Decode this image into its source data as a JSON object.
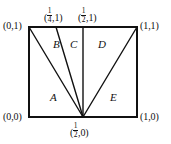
{
  "figure": {
    "type": "geometry-diagram",
    "background_color": "#ffffff",
    "line_color": "#111111",
    "border_width_px": 2,
    "interior_line_width_px": 1.4,
    "square": {
      "corners": {
        "bottom_left": "(0,0)",
        "bottom_right": "(1,0)",
        "top_right": "(1,1)",
        "top_left": "(0,1)"
      }
    },
    "apex": {
      "label_parts": {
        "x_num": "1",
        "x_den": "2",
        "y": "0"
      },
      "label_plain": "(1/2,0)",
      "position": "bottom edge midpoint"
    },
    "top_marks": [
      {
        "name": "quarter-top",
        "label_parts": {
          "x_num": "1",
          "x_den": "4",
          "y": "1"
        },
        "label_plain": "(1/4,1)"
      },
      {
        "name": "half-top",
        "label_parts": {
          "x_num": "1",
          "x_den": "2",
          "y": "1"
        },
        "label_plain": "(1/2,1)"
      }
    ],
    "corner_labels": {
      "top_left": "(0,1)",
      "top_right": "(1,1)",
      "bottom_left": "(0,0)",
      "bottom_right": "(1,0)"
    },
    "regions": [
      {
        "id": "A",
        "label": "A",
        "note": "lower-left region"
      },
      {
        "id": "B",
        "label": "B",
        "note": "upper wedge between (0,1) and (1/4,1) rays"
      },
      {
        "id": "C",
        "label": "C",
        "note": "narrow wedge between (1/4,1) and (1/2,1) rays"
      },
      {
        "id": "D",
        "label": "D",
        "note": "wedge between (1/2,1) and (1,1) rays"
      },
      {
        "id": "E",
        "label": "E",
        "note": "lower-right region"
      }
    ],
    "rays_from_apex": [
      {
        "to": "(0,1)"
      },
      {
        "to": "(1/4,1)"
      },
      {
        "to": "(1/2,1)"
      },
      {
        "to": "(1,1)"
      }
    ]
  }
}
